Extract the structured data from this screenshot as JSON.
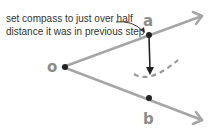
{
  "diagram": {
    "annotation": {
      "line1": "set compass to just over half",
      "line2": "distance it was in previous step"
    },
    "points": {
      "o": "o",
      "a": "a",
      "b": "b"
    },
    "colors": {
      "ray": "#a6a6a6",
      "point": "#222222",
      "label": "#8c8c8c",
      "arrow": "#222222",
      "arc": "#9a9a9a"
    }
  }
}
